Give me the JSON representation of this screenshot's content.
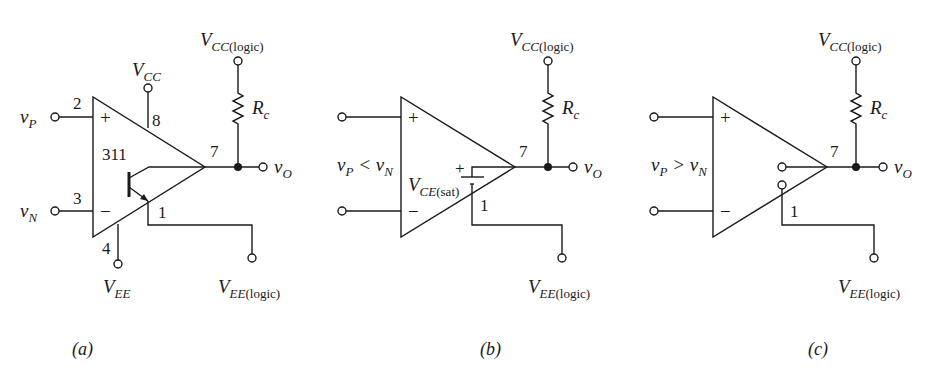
{
  "figure": {
    "panels": [
      {
        "id": "a",
        "caption": "(a)",
        "chip_label": "311",
        "pins": {
          "noninv": "2",
          "inv": "3",
          "vcc": "8",
          "vee": "4",
          "out": "7",
          "emitter": "1"
        },
        "inputs": {
          "noninv": "v",
          "noninv_sub": "P",
          "inv": "v",
          "inv_sub": "N"
        },
        "supplies": {
          "vcc": "V",
          "vcc_sub": "CC",
          "vee": "V",
          "vee_sub": "EE"
        },
        "signs": {
          "plus": "+",
          "minus": "−"
        },
        "pullup": {
          "supply": "V",
          "supply_sub": "CC",
          "supply_paren": "(logic)",
          "resistor": "R",
          "resistor_sub": "c"
        },
        "output": {
          "label": "v",
          "sub": "O"
        },
        "emitter_supply": {
          "label": "V",
          "sub": "EE",
          "paren": "(logic)"
        }
      },
      {
        "id": "b",
        "caption": "(b)",
        "condition": "v",
        "condition_sub1": "P",
        "condition_op": " < v",
        "condition_sub2": "N",
        "pins": {
          "out": "7",
          "emitter": "1"
        },
        "signs": {
          "plus": "+",
          "minus": "−",
          "sat_plus": "+"
        },
        "saturation": {
          "label": "V",
          "sub": "CE",
          "paren": "(sat)"
        },
        "pullup": {
          "supply": "V",
          "supply_sub": "CC",
          "supply_paren": "(logic)",
          "resistor": "R",
          "resistor_sub": "c"
        },
        "output": {
          "label": "v",
          "sub": "O"
        },
        "emitter_supply": {
          "label": "V",
          "sub": "EE",
          "paren": "(logic)"
        }
      },
      {
        "id": "c",
        "caption": "(c)",
        "condition": "v",
        "condition_sub1": "P",
        "condition_op": " > v",
        "condition_sub2": "N",
        "pins": {
          "out": "7",
          "emitter": "1"
        },
        "signs": {
          "plus": "+",
          "minus": "−"
        },
        "pullup": {
          "supply": "V",
          "supply_sub": "CC",
          "supply_paren": "(logic)",
          "resistor": "R",
          "resistor_sub": "c"
        },
        "output": {
          "label": "v",
          "sub": "O"
        },
        "emitter_supply": {
          "label": "V",
          "sub": "EE",
          "paren": "(logic)"
        }
      }
    ]
  }
}
